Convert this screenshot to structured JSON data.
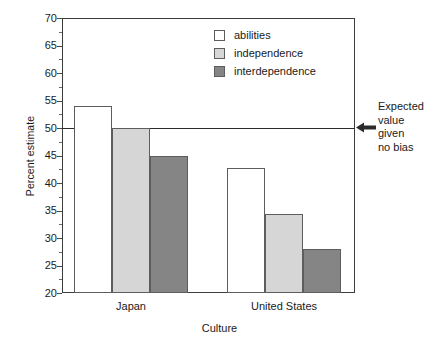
{
  "chart_data": {
    "type": "bar",
    "title": "",
    "xlabel": "Culture",
    "ylabel": "Percent estimate",
    "categories": [
      "Japan",
      "United States"
    ],
    "series": [
      {
        "name": "abilities",
        "color": "#ffffff",
        "values": [
          54,
          42.7
        ]
      },
      {
        "name": "independence",
        "color": "#d6d6d6",
        "values": [
          50,
          34.3
        ]
      },
      {
        "name": "interdependence",
        "color": "#858585",
        "values": [
          45,
          28
        ]
      }
    ],
    "ylim": [
      20,
      70
    ],
    "ytick_values": [
      20,
      25,
      30,
      35,
      40,
      45,
      50,
      55,
      60,
      65,
      70
    ],
    "ytick_labels": [
      "20",
      "25",
      "30",
      "35",
      "40",
      "45",
      "50",
      "55",
      "60",
      "65",
      "70"
    ],
    "grid": false,
    "legend_position": "top-center",
    "reference_line": {
      "value": 50,
      "label_lines": [
        "Expected",
        "value",
        "given",
        "no bias"
      ],
      "arrow": "left-arrow-icon"
    }
  },
  "axis": {
    "y_title": "Percent estimate",
    "x_title": "Culture"
  },
  "legend": {
    "items": [
      {
        "label": "abilities"
      },
      {
        "label": "independence"
      },
      {
        "label": "interdependence"
      }
    ]
  },
  "annotation": {
    "line1": "Expected",
    "line2": "value",
    "line3": "given",
    "line4": "no bias"
  }
}
